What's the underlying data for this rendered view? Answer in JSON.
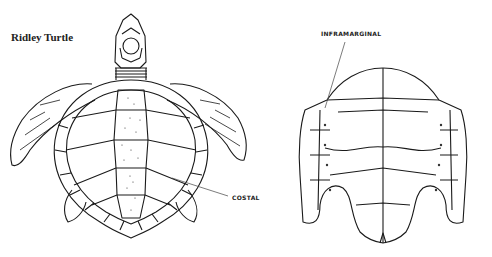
{
  "figure": {
    "title": "Ridley Turtle",
    "views": [
      {
        "name": "carapace-dorsal-view",
        "labels": [
          "COSTAL"
        ]
      },
      {
        "name": "plastron-ventral-view",
        "labels": [
          "INFRAMARGINAL"
        ]
      }
    ]
  },
  "labels": {
    "costal": "COSTAL",
    "inframarginal": "INFRAMARGINAL"
  },
  "colors": {
    "line": "#1a1a1a",
    "background": "#ffffff",
    "leader": "#444444"
  }
}
